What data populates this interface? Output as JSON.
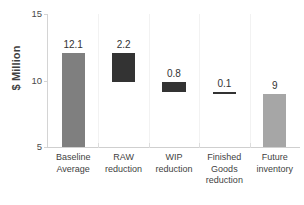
{
  "chart_data": {
    "type": "bar",
    "title": "",
    "subtitle": "",
    "xlabel": "",
    "ylabel": "$ Million",
    "ylim": [
      5,
      15
    ],
    "yticks": [
      5,
      10,
      15
    ],
    "ytick_labels": [
      "5",
      "10",
      "15"
    ],
    "grid": false,
    "legend": false,
    "legend_position": "none",
    "waterfall": true,
    "categories": [
      "Baseline Average",
      "RAW reduction",
      "WIP reduction",
      "Finished Goods reduction",
      "Future inventory"
    ],
    "values": [
      12.1,
      2.2,
      0.8,
      0.1,
      9
    ],
    "data_labels": [
      "12.1",
      "2.2",
      "0.8",
      "0.1",
      "9"
    ],
    "bar_spans": [
      {
        "bottom": 5.0,
        "top": 12.1
      },
      {
        "bottom": 9.9,
        "top": 12.1
      },
      {
        "bottom": 9.1,
        "top": 9.9
      },
      {
        "bottom": 9.0,
        "top": 9.1
      },
      {
        "bottom": 5.0,
        "top": 9.0
      }
    ],
    "bar_colors": [
      "#7f7f7f",
      "#333333",
      "#333333",
      "#333333",
      "#a6a6a6"
    ],
    "annotations": []
  },
  "axis": {
    "y_title": "$ Million"
  }
}
